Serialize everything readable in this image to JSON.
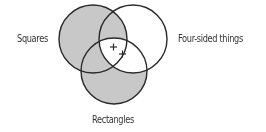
{
  "diagram": {
    "type": "venn",
    "sets": [
      {
        "id": "squares",
        "label": "Squares"
      },
      {
        "id": "four_sided",
        "label": "Four-sided things"
      },
      {
        "id": "rectangles",
        "label": "Rectangles"
      }
    ],
    "shaded_regions": [
      "squares-not-rectangles",
      "rectangles-not-four-sided"
    ],
    "marks": [
      "+",
      "+"
    ],
    "colors": {
      "shade": "#c8c8c8",
      "stroke": "#2a2a2a",
      "background": "#ffffff",
      "text": "#333333"
    }
  }
}
